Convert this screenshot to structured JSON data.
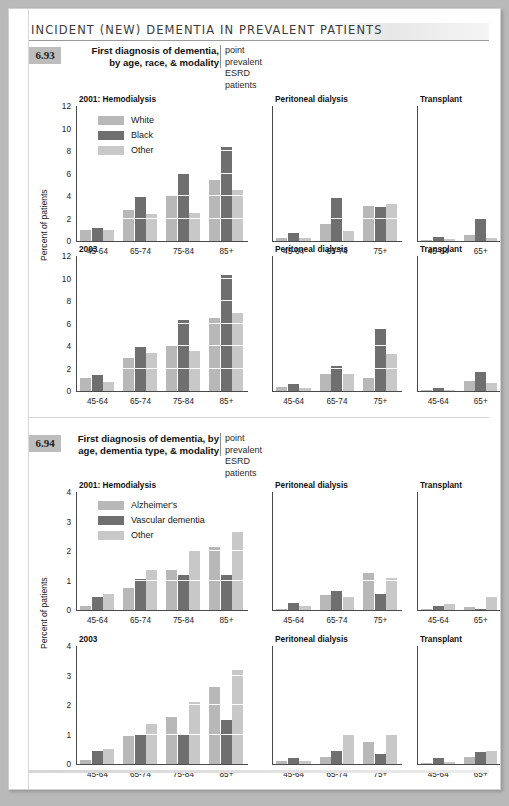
{
  "banner": {
    "title": "INCIDENT (NEW) DEMENTIA IN PREVALENT PATIENTS"
  },
  "figures": [
    {
      "number": "6.93",
      "title": "First diagnosis of dementia,\nby age, race, & modality",
      "title_line1": "First diagnosis of dementia,",
      "title_line2": "by age, race, & modality",
      "subtitle_line1": "point prevalent",
      "subtitle_line2": "ESRD patients",
      "ylabel": "Percent of patients",
      "legend": [
        {
          "label": "White",
          "color": "#b8b8b8"
        },
        {
          "label": "Black",
          "color": "#6f6f6f"
        },
        {
          "label": "Other",
          "color": "#c8c8c8"
        }
      ],
      "chart_data": {
        "type": "bar",
        "title": "First diagnosis of dementia, by age, race, & modality",
        "xlabel": "",
        "ylabel": "Percent of patients",
        "ylim": [
          0,
          12
        ],
        "yticks": [
          0,
          2,
          4,
          6,
          8,
          10,
          12
        ],
        "grid": "horizontal-white-on-bars",
        "legend_position": "inside-top-left",
        "rows": [
          {
            "row_label": "2001",
            "panels": [
              {
                "name": "2001: Hemodialysis",
                "categories": [
                  "45-64",
                  "65-74",
                  "75-84",
                  "85+"
                ],
                "series": [
                  {
                    "name": "White",
                    "values": [
                      1.0,
                      2.8,
                      4.1,
                      5.4
                    ]
                  },
                  {
                    "name": "Black",
                    "values": [
                      1.2,
                      3.9,
                      6.0,
                      8.4
                    ]
                  },
                  {
                    "name": "Other",
                    "values": [
                      1.0,
                      2.4,
                      2.5,
                      4.5
                    ]
                  }
                ]
              },
              {
                "name": "Peritoneal dialysis",
                "categories": [
                  "45-64",
                  "65-74",
                  "75+"
                ],
                "series": [
                  {
                    "name": "White",
                    "values": [
                      0.3,
                      1.5,
                      3.1
                    ]
                  },
                  {
                    "name": "Black",
                    "values": [
                      0.7,
                      3.8,
                      3.0
                    ]
                  },
                  {
                    "name": "Other",
                    "values": [
                      0.3,
                      0.9,
                      3.3
                    ]
                  }
                ]
              },
              {
                "name": "Transplant",
                "categories": [
                  "45-64",
                  "65+"
                ],
                "series": [
                  {
                    "name": "White",
                    "values": [
                      0.1,
                      0.5
                    ]
                  },
                  {
                    "name": "Black",
                    "values": [
                      0.4,
                      2.0
                    ]
                  },
                  {
                    "name": "Other",
                    "values": [
                      0.2,
                      0.3
                    ]
                  }
                ]
              }
            ]
          },
          {
            "row_label": "2003",
            "panels": [
              {
                "name": "2003",
                "categories": [
                  "45-64",
                  "65-74",
                  "75-84",
                  "85+"
                ],
                "series": [
                  {
                    "name": "White",
                    "values": [
                      1.2,
                      2.9,
                      4.1,
                      6.5
                    ]
                  },
                  {
                    "name": "Black",
                    "values": [
                      1.4,
                      3.9,
                      6.3,
                      10.3
                    ]
                  },
                  {
                    "name": "Other",
                    "values": [
                      0.8,
                      3.4,
                      3.6,
                      6.9
                    ]
                  }
                ]
              },
              {
                "name": "Peritoneal dialysis",
                "categories": [
                  "45-64",
                  "65-74",
                  "75+"
                ],
                "series": [
                  {
                    "name": "White",
                    "values": [
                      0.4,
                      1.5,
                      1.2
                    ]
                  },
                  {
                    "name": "Black",
                    "values": [
                      0.6,
                      2.2,
                      5.5
                    ]
                  },
                  {
                    "name": "Other",
                    "values": [
                      0.3,
                      1.5,
                      3.3
                    ]
                  }
                ]
              },
              {
                "name": "Transplant",
                "categories": [
                  "45-64",
                  "65+"
                ],
                "series": [
                  {
                    "name": "White",
                    "values": [
                      0.1,
                      0.9
                    ]
                  },
                  {
                    "name": "Black",
                    "values": [
                      0.3,
                      1.7
                    ]
                  },
                  {
                    "name": "Other",
                    "values": [
                      0.1,
                      0.7
                    ]
                  }
                ]
              }
            ]
          }
        ]
      }
    },
    {
      "number": "6.94",
      "title_line1": "First diagnosis of dementia, by",
      "title_line2": "age, dementia type, & modality",
      "subtitle_line1": "point prevalent",
      "subtitle_line2": "ESRD patients",
      "ylabel": "Percent of patients",
      "legend": [
        {
          "label": "Alzheimer's",
          "color": "#b8b8b8"
        },
        {
          "label": "Vascular dementia",
          "color": "#6f6f6f"
        },
        {
          "label": "Other",
          "color": "#c8c8c8"
        }
      ],
      "chart_data": {
        "type": "bar",
        "title": "First diagnosis of dementia, by age, dementia type, & modality",
        "xlabel": "",
        "ylabel": "Percent of patients",
        "ylim": [
          0,
          4
        ],
        "yticks": [
          0,
          1,
          2,
          3,
          4
        ],
        "grid": "horizontal-white-on-bars",
        "legend_position": "inside-top-left",
        "rows": [
          {
            "row_label": "2001",
            "panels": [
              {
                "name": "2001: Hemodialysis",
                "categories": [
                  "45-64",
                  "65-74",
                  "75-84",
                  "85+"
                ],
                "series": [
                  {
                    "name": "Alzheimer's",
                    "values": [
                      0.15,
                      0.75,
                      1.35,
                      2.15
                    ]
                  },
                  {
                    "name": "Vascular dementia",
                    "values": [
                      0.45,
                      1.05,
                      1.2,
                      1.2
                    ]
                  },
                  {
                    "name": "Other",
                    "values": [
                      0.55,
                      1.35,
                      2.0,
                      2.65
                    ]
                  }
                ]
              },
              {
                "name": "Peritoneal dialysis",
                "categories": [
                  "45-64",
                  "65-74",
                  "75+"
                ],
                "series": [
                  {
                    "name": "Alzheimer's",
                    "values": [
                      0.05,
                      0.5,
                      1.25
                    ]
                  },
                  {
                    "name": "Vascular dementia",
                    "values": [
                      0.25,
                      0.65,
                      0.55
                    ]
                  },
                  {
                    "name": "Other",
                    "values": [
                      0.15,
                      0.45,
                      1.1
                    ]
                  }
                ]
              },
              {
                "name": "Transplant",
                "categories": [
                  "45-64",
                  "65+"
                ],
                "series": [
                  {
                    "name": "Alzheimer's",
                    "values": [
                      0.05,
                      0.1
                    ]
                  },
                  {
                    "name": "Vascular dementia",
                    "values": [
                      0.15,
                      0.05
                    ]
                  },
                  {
                    "name": "Other",
                    "values": [
                      0.2,
                      0.45
                    ]
                  }
                ]
              }
            ]
          },
          {
            "row_label": "2003",
            "panels": [
              {
                "name": "2003",
                "categories": [
                  "45-64",
                  "65-74",
                  "75-84",
                  "85+"
                ],
                "series": [
                  {
                    "name": "Alzheimer's",
                    "values": [
                      0.15,
                      0.95,
                      1.6,
                      2.6
                    ]
                  },
                  {
                    "name": "Vascular dementia",
                    "values": [
                      0.45,
                      1.0,
                      1.0,
                      1.5
                    ]
                  },
                  {
                    "name": "Other",
                    "values": [
                      0.5,
                      1.35,
                      2.1,
                      3.2
                    ]
                  }
                ]
              },
              {
                "name": "Peritoneal dialysis",
                "categories": [
                  "45-64",
                  "65-74",
                  "75+"
                ],
                "series": [
                  {
                    "name": "Alzheimer's",
                    "values": [
                      0.1,
                      0.25,
                      0.75
                    ]
                  },
                  {
                    "name": "Vascular dementia",
                    "values": [
                      0.2,
                      0.45,
                      0.35
                    ]
                  },
                  {
                    "name": "Other",
                    "values": [
                      0.1,
                      1.0,
                      1.0
                    ]
                  }
                ]
              },
              {
                "name": "Transplant",
                "categories": [
                  "45-64",
                  "65+"
                ],
                "series": [
                  {
                    "name": "Alzheimer's",
                    "values": [
                      0.05,
                      0.25
                    ]
                  },
                  {
                    "name": "Vascular dementia",
                    "values": [
                      0.2,
                      0.4
                    ]
                  },
                  {
                    "name": "Other",
                    "values": [
                      0.08,
                      0.45
                    ]
                  }
                ]
              }
            ]
          }
        ]
      }
    }
  ],
  "colors": {
    "series1": "#b8b8b8",
    "series2": "#6f6f6f",
    "series3": "#c8c8c8",
    "axis": "#4a4a4a",
    "fig_num_bg": "#bdbdbd",
    "page_bg": "#ffffff",
    "outer_bg": "#b9b9b9"
  }
}
